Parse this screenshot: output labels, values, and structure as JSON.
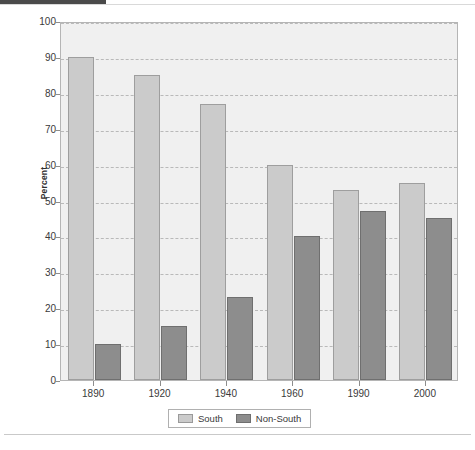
{
  "chart_data": {
    "type": "bar",
    "title": "",
    "subtitle": "",
    "xlabel": "",
    "ylabel": "Percent",
    "categories": [
      "1890",
      "1920",
      "1940",
      "1960",
      "1990",
      "2000"
    ],
    "series": [
      {
        "name": "South",
        "color": "#cbcbcb",
        "values": [
          90,
          85,
          77,
          60,
          53,
          55
        ]
      },
      {
        "name": "Non-South",
        "color": "#8d8d8d",
        "values": [
          10,
          15,
          23,
          40,
          47,
          45
        ]
      }
    ],
    "ylim": [
      0,
      100
    ],
    "ytick_values": [
      0,
      10,
      20,
      30,
      40,
      50,
      60,
      70,
      80,
      90,
      100
    ],
    "ytick_labels": [
      "0",
      "10",
      "20",
      "30",
      "40",
      "50",
      "60",
      "70",
      "80",
      "90",
      "100"
    ],
    "grid": true,
    "grid_style": "dashed-horizontal",
    "legend_position": "bottom-center",
    "plot_background": "#f0f0f0"
  },
  "figure": {
    "y_axis_title": "Percent"
  },
  "legend": {
    "entries": [
      {
        "label": "South"
      },
      {
        "label": "Non-South"
      }
    ]
  },
  "footer": {
    "caption": ""
  }
}
